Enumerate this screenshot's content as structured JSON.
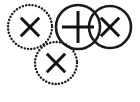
{
  "figure": {
    "background_color": "#ffffff",
    "stroke_color": "#1a1a1a",
    "mark_color": "#111111",
    "width": 140,
    "height": 102
  },
  "chart_data": {
    "type": "diagram",
    "xlabel": "",
    "ylabel": "",
    "xlim": [
      0,
      140
    ],
    "ylim": [
      0,
      102
    ],
    "grid": false,
    "legend": "none",
    "categories": [
      "circle-1",
      "circle-2",
      "circle-3",
      "circle-4"
    ],
    "values": [
      1,
      1,
      1,
      1
    ],
    "nodes": [
      {
        "id": "circle-1",
        "label": "dotted circle with X",
        "mark": "x",
        "outline": "dotted",
        "cx": 30,
        "cy": 27,
        "r": 22,
        "mark_radius": 13
      },
      {
        "id": "circle-2",
        "label": "solid circle with plus",
        "mark": "plus",
        "outline": "solid",
        "cx": 78,
        "cy": 27,
        "r": 22,
        "mark_radius": 16
      },
      {
        "id": "circle-3",
        "label": "solid circle with X",
        "mark": "x",
        "outline": "solid",
        "cx": 110,
        "cy": 27,
        "r": 21,
        "mark_radius": 13
      },
      {
        "id": "circle-4",
        "label": "dotted circle with X",
        "mark": "x",
        "outline": "dotted",
        "cx": 56,
        "cy": 63,
        "r": 21,
        "mark_radius": 13
      }
    ]
  }
}
